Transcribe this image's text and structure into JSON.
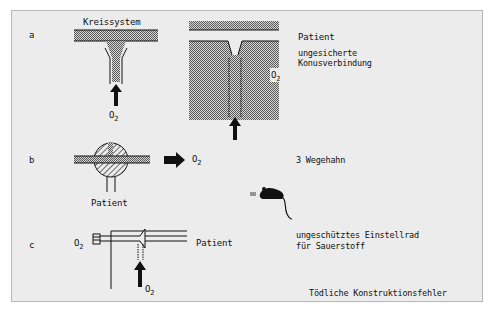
{
  "figure": {
    "caption": "Tödliche Konstruktionsfehler",
    "panels": {
      "a": {
        "letter": "a",
        "left_title": "Kreissystem",
        "left_gas": "O2",
        "right_patient": "Patient",
        "right_gas": "O2",
        "description_line1": "ungesicherte",
        "description_line2": "Konusverbindung"
      },
      "b": {
        "letter": "b",
        "patient": "Patient",
        "gas": "O2",
        "description": "3 Wegehahn"
      },
      "c": {
        "letter": "c",
        "gas_left": "O2",
        "gas_bottom": "O2",
        "patient": "Patient",
        "description_line1": "ungeschütztes Einstellrad",
        "description_line2": "für Sauerstoff"
      }
    },
    "icons": [
      "mouse-icon"
    ],
    "colors": {
      "background": "#ffffff",
      "panel": "#ececec",
      "ink": "#111111",
      "stipple": "#8a8a8a"
    }
  }
}
